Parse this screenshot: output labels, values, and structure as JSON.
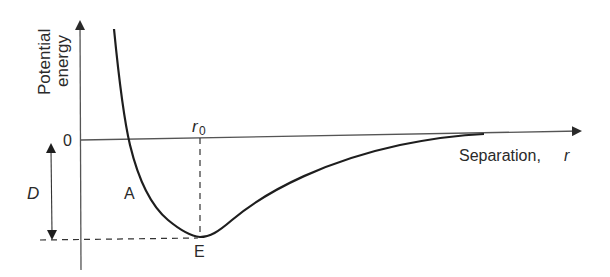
{
  "diagram": {
    "y_axis_label_line1": "Potential",
    "y_axis_label_line2": "energy",
    "x_axis_label": "Separation,",
    "x_axis_symbol": "r",
    "zero_label": "0",
    "r0_label": "r",
    "r0_subscript": "0",
    "depth_label": "D",
    "point_a_label": "A",
    "point_e_label": "E",
    "colors": {
      "ink": "#2a2a2a",
      "axis": "#555555",
      "background": "#ffffff"
    }
  }
}
